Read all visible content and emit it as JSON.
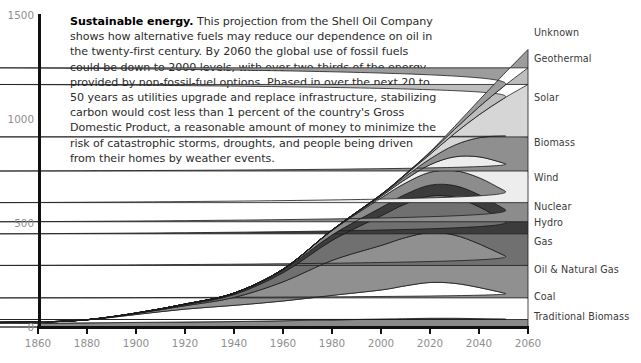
{
  "caption": {
    "lead": "Sustainable energy.",
    "body": " This projection from the Shell Oil Company shows how alternative fuels may reduce our dependence on oil in the twenty-first century. By 2060 the global use of fossil fuels could be down to 2000 levels, with over two-thirds of the energy provided by non-fossil-fuel options. Phased in over the next 20 to 50 years as utilities upgrade and replace infrastructure, stabilizing carbon would cost less than 1 percent of the country's Gross Domestic Product, a reasonable amount of money to minimize the risk of catastrophic storms, droughts, and people being driven from their homes by weather events."
  },
  "chart_data": {
    "type": "area",
    "title": "Sustainable energy",
    "xlabel": "",
    "ylabel": "",
    "xlim": [
      1860,
      2060
    ],
    "ylim": [
      0,
      1500
    ],
    "grid": false,
    "legend_position": "right-outside",
    "xticks": [
      1860,
      1880,
      1900,
      1920,
      1940,
      1960,
      1980,
      2000,
      2020,
      2040,
      2060
    ],
    "yticks": [
      0,
      500,
      1000,
      1500
    ],
    "stacked": true,
    "stack_order_bottom_to_top": [
      "Traditional Biomass",
      "Coal",
      "Oil & Natural Gas",
      "Gas",
      "Hydro",
      "Nuclear",
      "Wind",
      "Biomass",
      "Solar",
      "Geothermal",
      "Unknown"
    ],
    "x": [
      1860,
      1880,
      1900,
      1920,
      1940,
      1960,
      1980,
      2000,
      2010,
      2020,
      2030,
      2040,
      2050,
      2060
    ],
    "series": [
      {
        "name": "Traditional Biomass",
        "color": "#8a8a8a",
        "label_y": 316,
        "values": [
          18,
          20,
          22,
          24,
          26,
          30,
          34,
          38,
          40,
          42,
          42,
          40,
          38,
          36
        ]
      },
      {
        "name": "Coal",
        "color": "#ffffff",
        "label_y": 296,
        "values": [
          4,
          14,
          38,
          62,
          78,
          95,
          118,
          140,
          158,
          172,
          168,
          150,
          126,
          104
        ]
      },
      {
        "name": "Oil & Natural Gas",
        "color": "#909090",
        "label_y": 269,
        "values": [
          0,
          1,
          5,
          16,
          38,
          92,
          168,
          214,
          232,
          240,
          232,
          210,
          182,
          156
        ]
      },
      {
        "name": "Gas",
        "color": "#707070",
        "label_y": 241,
        "values": [
          0,
          0,
          1,
          5,
          14,
          44,
          96,
          142,
          162,
          176,
          182,
          178,
          166,
          152
        ]
      },
      {
        "name": "Hydro",
        "color": "#3c3c3c",
        "label_y": 222,
        "values": [
          0,
          0,
          1,
          3,
          7,
          14,
          26,
          40,
          46,
          52,
          56,
          58,
          58,
          58
        ]
      },
      {
        "name": "Nuclear",
        "color": "#8c8c8c",
        "label_y": 206,
        "values": [
          0,
          0,
          0,
          0,
          0,
          3,
          22,
          46,
          54,
          62,
          72,
          82,
          88,
          92
        ]
      },
      {
        "name": "Wind",
        "color": "#ededed",
        "label_y": 177,
        "values": [
          0,
          0,
          0,
          0,
          0,
          0,
          1,
          8,
          18,
          36,
          66,
          100,
          130,
          152
        ]
      },
      {
        "name": "Biomass",
        "color": "#8f8f8f",
        "label_y": 142,
        "values": [
          0,
          0,
          0,
          0,
          0,
          0,
          1,
          6,
          14,
          28,
          56,
          92,
          130,
          164
        ]
      },
      {
        "name": "Solar",
        "color": "#d6d6d6",
        "label_y": 97,
        "values": [
          0,
          0,
          0,
          0,
          0,
          0,
          0,
          2,
          8,
          22,
          56,
          110,
          180,
          252
        ]
      },
      {
        "name": "Geothermal",
        "color": "#bdbdbd",
        "label_y": 58,
        "values": [
          0,
          0,
          0,
          0,
          0,
          0,
          0,
          1,
          3,
          8,
          20,
          38,
          58,
          80
        ]
      },
      {
        "name": "Unknown",
        "color": "#9c9c9c",
        "label_y": 32,
        "values": [
          0,
          0,
          0,
          0,
          0,
          0,
          0,
          0,
          1,
          4,
          14,
          32,
          58,
          88
        ]
      }
    ]
  },
  "geometry": {
    "plot_left": 38,
    "plot_right": 528,
    "plot_top": 15,
    "plot_bottom": 327
  }
}
